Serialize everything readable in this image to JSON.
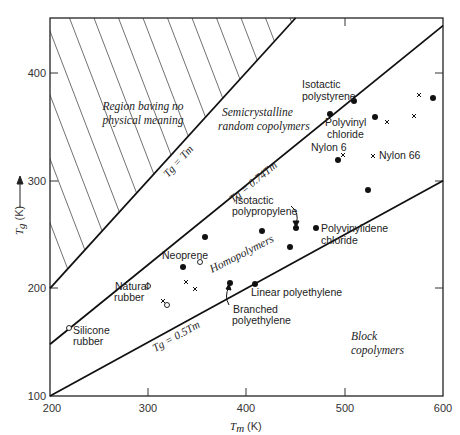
{
  "chart_data": {
    "type": "scatter",
    "title": "",
    "xlabel": "Tm (K)",
    "ylabel": "Tg (K)",
    "xlim": [
      200,
      600
    ],
    "ylim": [
      100,
      450
    ],
    "x_ticks": [
      200,
      300,
      400,
      500,
      600
    ],
    "y_ticks": [
      100,
      200,
      300,
      400
    ],
    "x_tick_labels": [
      "200",
      "300",
      "400",
      "500",
      "600"
    ],
    "y_tick_labels": [
      "100",
      "200",
      "300",
      "400"
    ],
    "grid": false,
    "lines": [
      {
        "name": "Tg = Tm",
        "slope": 1.0,
        "label": "Tg = Tm"
      },
      {
        "name": "Tg = 0.74Tm",
        "slope": 0.74,
        "label": "Tg = 0.74Tm"
      },
      {
        "name": "Tg = 0.5Tm",
        "slope": 0.5,
        "label": "Tg = 0.5Tm"
      }
    ],
    "regions": [
      {
        "label": "Region baving no physical meaning",
        "hatched": true
      },
      {
        "label": "Semicrystalline random copolymers"
      },
      {
        "label": "Homopolymers"
      },
      {
        "label": "Block copolymers"
      }
    ],
    "series": [
      {
        "name": "filled circles",
        "marker": "filled-circle",
        "points": [
          {
            "x": 509,
            "y": 374,
            "label": "Isotactic polystyrene"
          },
          {
            "x": 484,
            "y": 362,
            "label": "Polyvinyl chloride"
          },
          {
            "x": 530,
            "y": 359,
            "label": ""
          },
          {
            "x": 589,
            "y": 377,
            "label": ""
          },
          {
            "x": 492,
            "y": 319,
            "label": "Nylon 6"
          },
          {
            "x": 523,
            "y": 291,
            "label": ""
          },
          {
            "x": 357,
            "y": 248,
            "label": ""
          },
          {
            "x": 415,
            "y": 253,
            "label": ""
          },
          {
            "x": 450,
            "y": 256,
            "label": "Isotactic polypropylene"
          },
          {
            "x": 470,
            "y": 256,
            "label": "Polyvinylidene chloride"
          },
          {
            "x": 444,
            "y": 238,
            "label": ""
          },
          {
            "x": 335,
            "y": 220,
            "label": ""
          },
          {
            "x": 383,
            "y": 205,
            "label": "Branched polyethylene"
          },
          {
            "x": 408,
            "y": 204,
            "label": "Linear polyethylene"
          }
        ]
      },
      {
        "name": "crosses",
        "marker": "x",
        "points": [
          {
            "x": 575,
            "y": 380,
            "label": ""
          },
          {
            "x": 542,
            "y": 354,
            "label": ""
          },
          {
            "x": 570,
            "y": 360,
            "label": ""
          },
          {
            "x": 497,
            "y": 324,
            "label": ""
          },
          {
            "x": 528,
            "y": 323,
            "label": "Nylon 66"
          },
          {
            "x": 338,
            "y": 206,
            "label": ""
          },
          {
            "x": 347,
            "y": 200,
            "label": ""
          },
          {
            "x": 315,
            "y": 188,
            "label": ""
          }
        ]
      },
      {
        "name": "open circles",
        "marker": "open-circle",
        "points": [
          {
            "x": 352,
            "y": 224,
            "label": "Neoprene"
          },
          {
            "x": 300,
            "y": 202,
            "label": "Natural rubber"
          },
          {
            "x": 319,
            "y": 184,
            "label": ""
          },
          {
            "x": 219,
            "y": 163,
            "label": "Silicone rubber"
          }
        ]
      }
    ]
  },
  "labels": {
    "x_axis_title": "T",
    "x_axis_sub": "m",
    "x_axis_unit": "(K)",
    "y_axis_title": "T",
    "y_axis_sub": "g",
    "y_axis_unit": "(K)",
    "region_no_meaning_1": "Region baving no",
    "region_no_meaning_2": "physical meaning",
    "semicrystalline_1": "Semicrystalline",
    "semicrystalline_2": "random copolymers",
    "homopolymers": "Homopolymers",
    "block_1": "Block",
    "block_2": "copolymers",
    "eq_tg_tm": "Tg = Tm",
    "eq_074": "Tg = 0.74Tm",
    "eq_05": "Tg = 0.5Tm",
    "isotactic_ps_1": "Isotactic",
    "isotactic_ps_2": "polystyrene",
    "pvc_1": "Polyvinyl",
    "pvc_2": "chloride",
    "nylon6": "Nylon 6",
    "nylon66": "Nylon 66",
    "ipp_1": "Isotactic",
    "ipp_2": "polypropylene",
    "pvdc_1": "Polyvinylidene",
    "pvdc_2": "chloride",
    "neoprene": "Neoprene",
    "natural_rubber_1": "Natural",
    "natural_rubber_2": "rubber",
    "silicone_1": "Silicone",
    "silicone_2": "rubber",
    "linear_pe": "Linear polyethylene",
    "branched_pe_1": "Branched",
    "branched_pe_2": "polyethylene"
  }
}
